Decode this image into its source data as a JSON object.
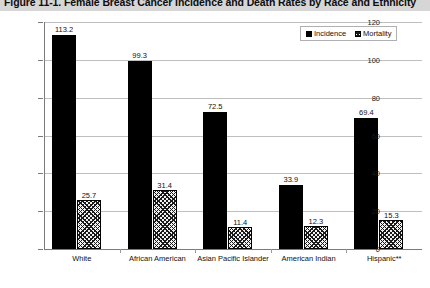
{
  "title": "Figure 11-1. Female Breast Cancer Incidence and Death Rates by Race and Ethnicity",
  "legend": {
    "incidence_label": "Incidence",
    "mortality_label": "Mortality"
  },
  "axis": {
    "ylabel": "Rate per 100,000",
    "yticks": [
      "120",
      "100",
      "80",
      "60",
      "40",
      "20",
      "0"
    ]
  },
  "chart_data": {
    "type": "bar",
    "title": "Figure 11-1. Female Breast Cancer Incidence and Death Rates by Race and Ethnicity",
    "xlabel": "",
    "ylabel": "Rate per 100,000",
    "ylim": [
      0,
      120
    ],
    "ytick_values": [
      0,
      20,
      40,
      60,
      80,
      100,
      120
    ],
    "grid": true,
    "legend_position": "top-right",
    "categories": [
      "White",
      "African American",
      "Asian Pacific Islander",
      "American Indian",
      "Hispanic**"
    ],
    "series": [
      {
        "name": "Incidence",
        "values": [
          113.2,
          99.3,
          72.5,
          33.9,
          69.4
        ],
        "labels": [
          "113.2",
          "99.3",
          "72.5",
          "33.9",
          "69.4"
        ]
      },
      {
        "name": "Mortality",
        "values": [
          25.7,
          31.4,
          11.4,
          12.3,
          15.3
        ],
        "labels": [
          "25.7",
          "31.4",
          "11.4",
          "12.3",
          "15.3"
        ]
      }
    ]
  },
  "colors": {
    "incidence": "#000000",
    "mortality": "#ffffff",
    "grid": "#bfbfbf",
    "axis": "#7a7a7a",
    "title_band": "#d6d6d6"
  }
}
